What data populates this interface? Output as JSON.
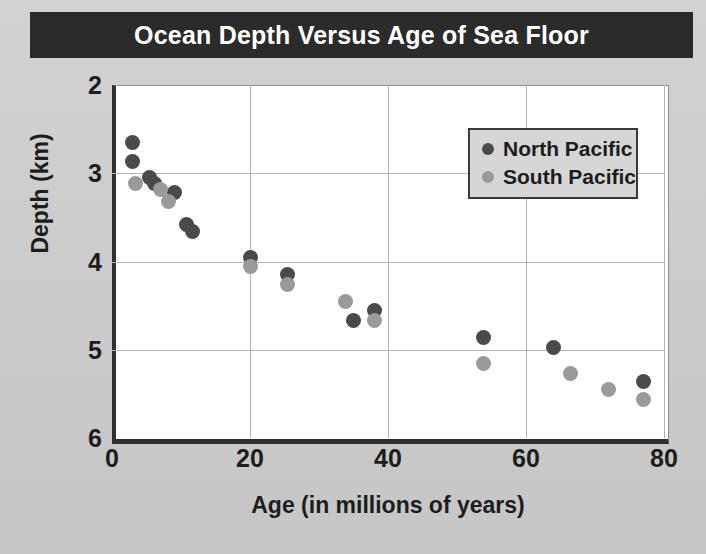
{
  "title": "Ocean Depth Versus Age of Sea Floor",
  "legend": {
    "position": "inside-top-right",
    "entries": [
      {
        "label": "North Pacific",
        "color": "#4a4a4a",
        "key": "north"
      },
      {
        "label": "South Pacific",
        "color": "#9a9a9a",
        "key": "south"
      }
    ]
  },
  "axes": {
    "x": {
      "label": "Age (in millions of years)",
      "ticks": [
        "0",
        "20",
        "40",
        "60",
        "80"
      ],
      "min": 0,
      "max": 80
    },
    "y": {
      "label": "Depth (km)",
      "ticks": [
        "2",
        "3",
        "4",
        "5",
        "6"
      ],
      "min": 2,
      "max": 6,
      "inverted": true
    }
  },
  "colors": {
    "banner_bg": "#2b2b2b",
    "banner_text": "#ffffff",
    "page_bg": "#cfcfcf",
    "plot_bg": "#ffffff",
    "grid": "#b3b3b3",
    "axis": "#2f2f2f",
    "north_pacific": "#4a4a4a",
    "south_pacific": "#9a9a9a"
  },
  "chart_data": {
    "type": "scatter",
    "title": "Ocean Depth Versus Age of Sea Floor",
    "xlabel": "Age (in millions of years)",
    "ylabel": "Depth (km)",
    "xlim": [
      0,
      80
    ],
    "ylim": [
      2,
      6
    ],
    "y_axis_inverted": true,
    "grid": true,
    "legend_position": "inside-top-right",
    "xticks": [
      0,
      20,
      40,
      60,
      80
    ],
    "yticks": [
      2,
      3,
      4,
      5,
      6
    ],
    "series": [
      {
        "name": "North Pacific",
        "color": "#4a4a4a",
        "points": [
          {
            "x": 3.0,
            "y": 2.65
          },
          {
            "x": 3.0,
            "y": 2.87
          },
          {
            "x": 5.5,
            "y": 3.05
          },
          {
            "x": 6.2,
            "y": 3.12
          },
          {
            "x": 9.0,
            "y": 3.22
          },
          {
            "x": 10.8,
            "y": 3.58
          },
          {
            "x": 11.6,
            "y": 3.66
          },
          {
            "x": 20.0,
            "y": 3.95
          },
          {
            "x": 25.5,
            "y": 4.15
          },
          {
            "x": 35.0,
            "y": 4.67
          },
          {
            "x": 38.0,
            "y": 4.56
          },
          {
            "x": 53.8,
            "y": 4.86
          },
          {
            "x": 64.0,
            "y": 4.97
          },
          {
            "x": 77.0,
            "y": 5.36
          }
        ]
      },
      {
        "name": "South Pacific",
        "color": "#9a9a9a",
        "points": [
          {
            "x": 3.4,
            "y": 3.12
          },
          {
            "x": 7.0,
            "y": 3.18
          },
          {
            "x": 8.2,
            "y": 3.32
          },
          {
            "x": 20.0,
            "y": 4.06
          },
          {
            "x": 25.5,
            "y": 4.26
          },
          {
            "x": 33.8,
            "y": 4.45
          },
          {
            "x": 38.0,
            "y": 4.67
          },
          {
            "x": 53.8,
            "y": 5.16
          },
          {
            "x": 66.5,
            "y": 5.27
          },
          {
            "x": 72.0,
            "y": 5.45
          },
          {
            "x": 77.0,
            "y": 5.56
          }
        ]
      }
    ]
  }
}
